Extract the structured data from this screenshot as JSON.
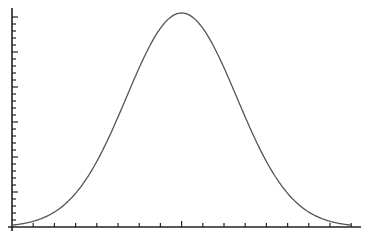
{
  "chart_data": {
    "type": "line",
    "title": "",
    "xlabel": "",
    "ylabel": "",
    "grid": false,
    "legend": null,
    "series": [
      {
        "name": "normal distribution curve",
        "kind": "gaussian",
        "mean": 8,
        "std_dev": 2.6,
        "peak": 1.0,
        "x_range": [
          0,
          16
        ]
      }
    ],
    "xlim": [
      0,
      16.3
    ],
    "ylim": [
      0,
      1.05
    ],
    "x_ticks": {
      "count": 17,
      "step": 1,
      "major_tick_index": 8,
      "labels": []
    },
    "y_ticks": {
      "count": 31,
      "step": 1,
      "major_every": 5,
      "labels": []
    },
    "colors": {
      "axis": "#222222",
      "curve": "#555555",
      "background": "#ffffff"
    }
  }
}
